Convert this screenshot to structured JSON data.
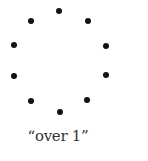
{
  "diagram": {
    "caption": "“over 1”",
    "dot_color": "#111111",
    "dots": [
      {
        "x": 59,
        "y": 11
      },
      {
        "x": 31,
        "y": 21
      },
      {
        "x": 88,
        "y": 21
      },
      {
        "x": 14,
        "y": 45
      },
      {
        "x": 106,
        "y": 46
      },
      {
        "x": 14,
        "y": 76
      },
      {
        "x": 106,
        "y": 75
      },
      {
        "x": 31,
        "y": 101
      },
      {
        "x": 87,
        "y": 100
      },
      {
        "x": 60,
        "y": 112
      }
    ]
  }
}
